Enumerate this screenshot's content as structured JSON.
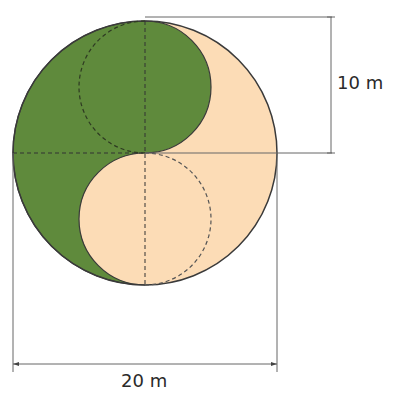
{
  "diagram": {
    "colors": {
      "green": "#5f8a3c",
      "cream": "#fcdcb6",
      "outline": "#3a3a3a",
      "dim_line": "#555555"
    },
    "labels": {
      "height_dimension": "10 m",
      "width_dimension": "20 m"
    }
  }
}
